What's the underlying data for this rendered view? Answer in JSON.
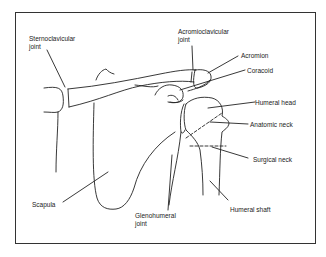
{
  "diagram": {
    "labels": {
      "sternoclavicular": "Sternoclavicular",
      "sternoclavicular2": "joint",
      "acromioclavicular": "Acromioclavicular",
      "acromioclavicular2": "joint",
      "acromion": "Acromion",
      "coracoid": "Coracoid",
      "humeral_head": "Humeral head",
      "anatomic_neck": "Anatomic neck",
      "surgical_neck": "Surgical neck",
      "humeral_shaft": "Humeral shaft",
      "scapula": "Scapula",
      "glenohumeral": "Glenohumeral",
      "glenohumeral2": "joint"
    },
    "line_color": "#222222"
  }
}
